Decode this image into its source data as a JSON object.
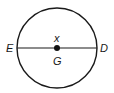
{
  "diagram": {
    "type": "circle-with-diameter",
    "circle": {
      "cx": 57,
      "cy": 48,
      "r": 40,
      "stroke": "#1a1a1a"
    },
    "diameter": {
      "from": "E",
      "to": "D"
    },
    "center": {
      "label": "G",
      "point_label": "x"
    },
    "labels": {
      "left_endpoint": "E",
      "right_endpoint": "D",
      "center_below": "G",
      "center_above": "x"
    }
  }
}
